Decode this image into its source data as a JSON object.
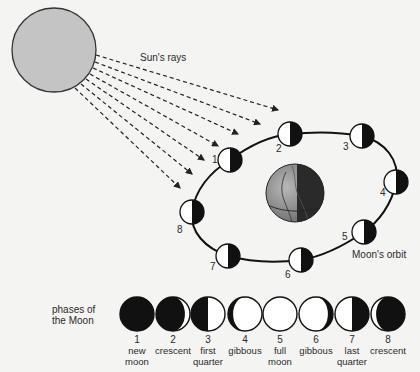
{
  "diagram": {
    "title_clipped": "",
    "sun": {
      "label": "Sun's rays",
      "fill": "#c4c4c4"
    },
    "orbit": {
      "label": "Moon's orbit"
    },
    "earth": {
      "label": ""
    },
    "orbit_moons": [
      {
        "num": "1",
        "x": 230,
        "y": 160,
        "lx": 212,
        "ly": 163
      },
      {
        "num": "2",
        "x": 290,
        "y": 134,
        "lx": 276,
        "ly": 152
      },
      {
        "num": "3",
        "x": 362,
        "y": 136,
        "lx": 343,
        "ly": 150
      },
      {
        "num": "4",
        "x": 396,
        "y": 182,
        "lx": 380,
        "ly": 196
      },
      {
        "num": "5",
        "x": 364,
        "y": 232,
        "lx": 342,
        "ly": 240
      },
      {
        "num": "6",
        "x": 301,
        "y": 260,
        "lx": 285,
        "ly": 278
      },
      {
        "num": "7",
        "x": 228,
        "y": 256,
        "lx": 210,
        "ly": 270
      },
      {
        "num": "8",
        "x": 192,
        "y": 212,
        "lx": 177,
        "ly": 233
      }
    ],
    "phases_label": [
      "phases of",
      "the Moon"
    ],
    "phases": [
      {
        "num": "1",
        "line1": "new",
        "line2": "moon",
        "type": "new"
      },
      {
        "num": "2",
        "line1": "crescent",
        "line2": "",
        "type": "waxing-crescent"
      },
      {
        "num": "3",
        "line1": "first",
        "line2": "quarter",
        "type": "first-quarter"
      },
      {
        "num": "4",
        "line1": "gibbous",
        "line2": "",
        "type": "waxing-gibbous"
      },
      {
        "num": "5",
        "line1": "full",
        "line2": "moon",
        "type": "full"
      },
      {
        "num": "6",
        "line1": "gibbous",
        "line2": "",
        "type": "waning-gibbous"
      },
      {
        "num": "7",
        "line1": "last",
        "line2": "quarter",
        "type": "last-quarter"
      },
      {
        "num": "8",
        "line1": "crescent",
        "line2": "",
        "type": "waning-crescent"
      }
    ]
  }
}
